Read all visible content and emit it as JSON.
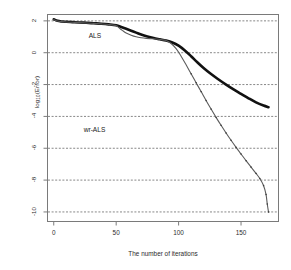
{
  "chart_data": {
    "type": "line",
    "title": "",
    "xlabel": "The number of iterations",
    "ylabel": "log10(Error)",
    "ylabel_base": "log",
    "ylabel_sub": "10",
    "ylabel_tail": "(Error)",
    "xlim": [
      -5,
      180
    ],
    "ylim": [
      -10.6,
      2.4
    ],
    "xticks": [
      0,
      50,
      100,
      150
    ],
    "xtick_labels": [
      "0",
      "50",
      "100",
      "150"
    ],
    "yticks": [
      2,
      0,
      -2,
      -4,
      -6,
      -8,
      -10
    ],
    "ytick_labels": [
      "2",
      "0",
      "-2",
      "-4",
      "-6",
      "-8",
      "-10"
    ],
    "grid": true,
    "grid_style": "dashed-horizontal",
    "grid_color": "#555555",
    "frame": true,
    "legend_position": "inline-annotations",
    "annotations": [
      {
        "text": "ALS",
        "x": 28,
        "y": 1.05
      },
      {
        "text": "wr-ALS",
        "x": 24,
        "y": -4.85
      }
    ],
    "series": [
      {
        "name": "ALS",
        "color": "#111111",
        "linewidth": 2.6,
        "style": "solid",
        "x": [
          0,
          3,
          6,
          10,
          15,
          20,
          26,
          32,
          38,
          44,
          50,
          54,
          58,
          62,
          66,
          70,
          75,
          80,
          85,
          90,
          95,
          100,
          105,
          110,
          115,
          120,
          126,
          132,
          138,
          144,
          150,
          156,
          162,
          168,
          172
        ],
        "y": [
          2.1,
          2.0,
          1.96,
          1.94,
          1.92,
          1.9,
          1.88,
          1.85,
          1.82,
          1.78,
          1.72,
          1.62,
          1.5,
          1.38,
          1.26,
          1.14,
          1.02,
          0.92,
          0.84,
          0.76,
          0.64,
          0.44,
          0.14,
          -0.22,
          -0.6,
          -0.96,
          -1.34,
          -1.68,
          -2.0,
          -2.3,
          -2.58,
          -2.86,
          -3.12,
          -3.32,
          -3.42
        ]
      },
      {
        "name": "wr-ALS",
        "color": "#5c5c5c",
        "linewidth": 1.1,
        "style": "solid-dotted",
        "x": [
          0,
          3,
          6,
          10,
          15,
          20,
          26,
          32,
          38,
          44,
          50,
          52,
          55,
          58,
          62,
          66,
          70,
          74,
          78,
          82,
          86,
          90,
          94,
          98,
          102,
          106,
          110,
          114,
          118,
          122,
          126,
          130,
          134,
          138,
          142,
          146,
          150,
          154,
          158,
          162,
          165,
          168,
          170,
          171,
          172
        ],
        "y": [
          2.08,
          1.99,
          1.95,
          1.93,
          1.91,
          1.89,
          1.87,
          1.84,
          1.81,
          1.77,
          1.7,
          1.58,
          1.4,
          1.24,
          1.1,
          1.0,
          0.94,
          0.9,
          0.88,
          0.86,
          0.82,
          0.76,
          0.58,
          0.26,
          -0.22,
          -0.76,
          -1.32,
          -1.88,
          -2.44,
          -3.0,
          -3.54,
          -4.06,
          -4.56,
          -5.04,
          -5.5,
          -5.94,
          -6.36,
          -6.78,
          -7.18,
          -7.58,
          -7.9,
          -8.34,
          -8.9,
          -9.5,
          -10.0
        ]
      }
    ]
  },
  "axes": {
    "ylabel_display_base": "log",
    "ylabel_display_sub": "10",
    "ylabel_display_tail": "(Error)"
  }
}
